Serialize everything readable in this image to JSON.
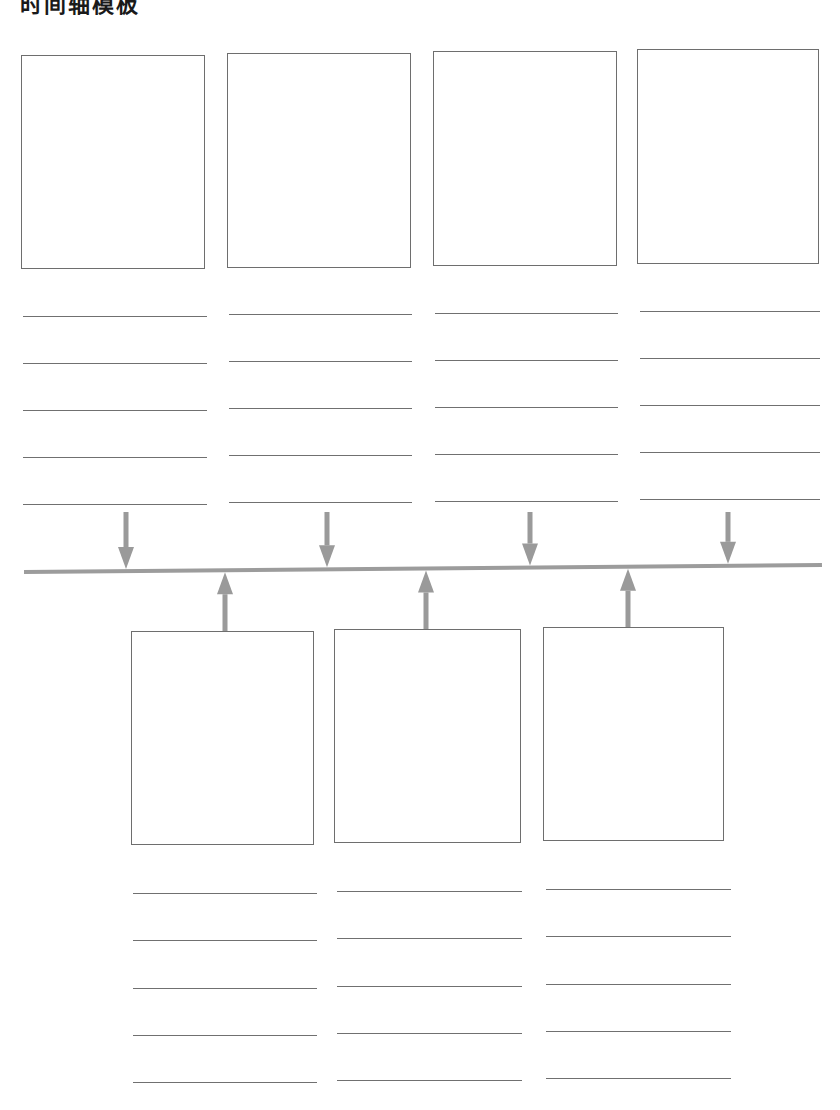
{
  "header": {
    "title": "时间轴模板"
  },
  "colors": {
    "box_border": "#6e6e6e",
    "line": "#707070",
    "timeline": "#9c9c9c",
    "arrow": "#9a9a9a",
    "background": "#ffffff"
  },
  "timeline": {
    "x1": 24,
    "y1": 572,
    "x2": 822,
    "y2": 565
  },
  "top_events": [
    {
      "box": {
        "x": 21,
        "y": 55,
        "w": 184,
        "h": 214
      },
      "arrow_x": 126,
      "lines": [
        316,
        363,
        410,
        457,
        504
      ],
      "line_x1": 23,
      "line_x2": 207
    },
    {
      "box": {
        "x": 227,
        "y": 53,
        "w": 184,
        "h": 215
      },
      "arrow_x": 327,
      "lines": [
        314,
        361,
        408,
        455,
        502
      ],
      "line_x1": 229,
      "line_x2": 412
    },
    {
      "box": {
        "x": 433,
        "y": 51,
        "w": 184,
        "h": 215
      },
      "arrow_x": 530,
      "lines": [
        313,
        360,
        407,
        454,
        501
      ],
      "line_x1": 435,
      "line_x2": 618
    },
    {
      "box": {
        "x": 637,
        "y": 49,
        "w": 182,
        "h": 215
      },
      "arrow_x": 728,
      "lines": [
        311,
        358,
        405,
        452,
        499
      ],
      "line_x1": 640,
      "line_x2": 820
    }
  ],
  "bottom_events": [
    {
      "box": {
        "x": 131,
        "y": 631,
        "w": 183,
        "h": 214
      },
      "arrow_x": 225,
      "lines": [
        893,
        940,
        988,
        1035,
        1082
      ],
      "line_x1": 133,
      "line_x2": 317
    },
    {
      "box": {
        "x": 334,
        "y": 629,
        "w": 187,
        "h": 214
      },
      "arrow_x": 426,
      "lines": [
        891,
        938,
        986,
        1033,
        1080
      ],
      "line_x1": 337,
      "line_x2": 522
    },
    {
      "box": {
        "x": 543,
        "y": 627,
        "w": 181,
        "h": 214
      },
      "arrow_x": 628,
      "lines": [
        889,
        936,
        984,
        1031,
        1078
      ],
      "line_x1": 546,
      "line_x2": 731
    }
  ]
}
